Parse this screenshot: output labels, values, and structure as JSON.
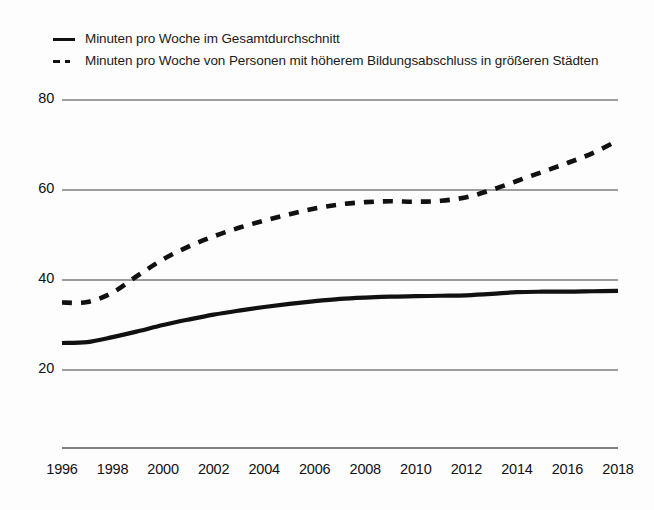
{
  "chart_data": {
    "type": "line",
    "title": "",
    "subtitle": "",
    "xlabel": "",
    "ylabel": "",
    "x": [
      1996,
      1997,
      1998,
      1999,
      2000,
      2001,
      2002,
      2003,
      2004,
      2005,
      2006,
      2007,
      2008,
      2009,
      2010,
      2011,
      2012,
      2013,
      2014,
      2015,
      2016,
      2017,
      2018
    ],
    "xlim": [
      1996,
      2018
    ],
    "ylim": [
      14,
      82
    ],
    "yticks": [
      20,
      40,
      60,
      80
    ],
    "ytick_labels": [
      "20",
      "40",
      "60",
      "80"
    ],
    "xticks": [
      1996,
      1998,
      2000,
      2002,
      2004,
      2006,
      2008,
      2010,
      2012,
      2014,
      2016,
      2018
    ],
    "xtick_labels": [
      "1996",
      "1998",
      "2000",
      "2002",
      "2004",
      "2006",
      "2008",
      "2010",
      "2012",
      "2014",
      "2016",
      "2018"
    ],
    "grid": "horizontal",
    "legend_position": "top-left",
    "series": [
      {
        "name": "Minuten pro Woche im Gesamtdurchschnitt",
        "style": "solid",
        "color": "#111111",
        "values": [
          26.0,
          26.2,
          27.3,
          28.6,
          30.0,
          31.2,
          32.3,
          33.2,
          34.0,
          34.7,
          35.3,
          35.8,
          36.1,
          36.3,
          36.4,
          36.5,
          36.6,
          36.9,
          37.3,
          37.4,
          37.4,
          37.5,
          37.6
        ]
      },
      {
        "name": "Minuten pro Woche von Personen mit höherem Bildungsabschluss in größeren Städten",
        "style": "dashed",
        "color": "#111111",
        "values": [
          35.0,
          35.1,
          37.2,
          41.0,
          44.6,
          47.4,
          49.7,
          51.6,
          53.2,
          54.6,
          55.9,
          56.8,
          57.3,
          57.5,
          57.4,
          57.6,
          58.4,
          60.0,
          62.0,
          64.0,
          66.0,
          68.2,
          71.0
        ]
      }
    ]
  },
  "legend": {
    "entries": [
      {
        "label": "Minuten pro Woche im Gesamtdurchschnitt",
        "marker": "solid-line-marker"
      },
      {
        "label": "Minuten pro Woche von Personen mit höherem Bildungsabschluss in größeren Städten",
        "marker": "dashed-line-marker"
      }
    ]
  },
  "axes": {
    "y_labels": [
      "80",
      "60",
      "40",
      "20"
    ],
    "x_labels": [
      "1996",
      "1998",
      "2000",
      "2002",
      "2004",
      "2006",
      "2008",
      "2010",
      "2012",
      "2014",
      "2016",
      "2018"
    ]
  },
  "colors": {
    "line": "#111111",
    "grid": "#7d7d7d",
    "axis": "#555555",
    "background": "#fdfdfd"
  }
}
